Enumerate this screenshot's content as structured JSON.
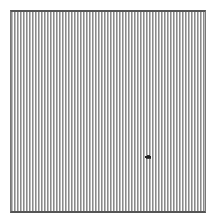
{
  "canvas": {
    "pattern": "vertical-stripes",
    "colors": {
      "stripe_dark": "#8a8a8a",
      "stripe_mid": "#bdbdbd",
      "stripe_light": "#ffffff",
      "border": "#555555"
    }
  },
  "cursor": {
    "icon": "pointer-cursor-icon",
    "x": 148,
    "y": 157
  }
}
